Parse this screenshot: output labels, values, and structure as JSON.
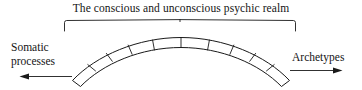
{
  "figure": {
    "title": "The conscious and unconscious psychic realm",
    "left_label": {
      "line1": "Somatic",
      "line2": "processes"
    },
    "right_label": "Archetypes",
    "ink_color": "#1a1a1a",
    "background_color": "#ffffff"
  },
  "diagram": {
    "brace_label": "span-brace",
    "band_segments": 9,
    "left_arrow_direction": "left",
    "right_arrow_direction": "right"
  }
}
